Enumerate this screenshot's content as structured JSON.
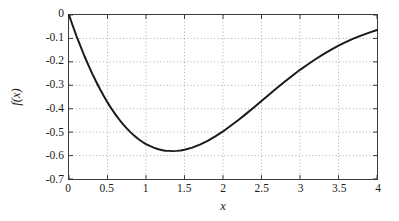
{
  "chart_data": {
    "type": "line",
    "title": "",
    "xlabel": "x",
    "ylabel": "f(x)",
    "xlim": [
      0,
      4
    ],
    "ylim": [
      -0.7,
      0
    ],
    "grid": true,
    "legend": null,
    "xticks": [
      "0",
      "0.5",
      "1",
      "1.5",
      "2",
      "2.5",
      "3",
      "3.5",
      "4"
    ],
    "xtick_values": [
      0,
      0.5,
      1,
      1.5,
      2,
      2.5,
      3,
      3.5,
      4
    ],
    "yticks": [
      "0",
      "-0.1",
      "-0.2",
      "-0.3",
      "-0.4",
      "-0.5",
      "-0.6",
      "-0.7"
    ],
    "ytick_values": [
      0,
      -0.1,
      -0.2,
      -0.3,
      -0.4,
      -0.5,
      -0.6,
      -0.7
    ],
    "series": [
      {
        "name": "f(x)",
        "color": "#1a1a1a",
        "linewidth": 2.0,
        "x": [
          0.0,
          0.05,
          0.1,
          0.15,
          0.2,
          0.25,
          0.3,
          0.35,
          0.4,
          0.45,
          0.5,
          0.55,
          0.6,
          0.65,
          0.7,
          0.75,
          0.8,
          0.85,
          0.9,
          0.95,
          1.0,
          1.05,
          1.1,
          1.15,
          1.2,
          1.25,
          1.3,
          1.35,
          1.4,
          1.45,
          1.5,
          1.6,
          1.7,
          1.8,
          1.9,
          2.0,
          2.1,
          2.2,
          2.3,
          2.4,
          2.5,
          2.6,
          2.7,
          2.8,
          2.9,
          3.0,
          3.1,
          3.2,
          3.3,
          3.4,
          3.5,
          3.6,
          3.7,
          3.8,
          3.9,
          4.0
        ],
        "y": [
          0.0,
          -0.047,
          -0.092,
          -0.134,
          -0.175,
          -0.213,
          -0.249,
          -0.283,
          -0.315,
          -0.345,
          -0.373,
          -0.399,
          -0.423,
          -0.445,
          -0.466,
          -0.484,
          -0.501,
          -0.516,
          -0.529,
          -0.541,
          -0.551,
          -0.559,
          -0.566,
          -0.572,
          -0.576,
          -0.579,
          -0.58,
          -0.581,
          -0.58,
          -0.578,
          -0.575,
          -0.566,
          -0.553,
          -0.537,
          -0.518,
          -0.497,
          -0.473,
          -0.448,
          -0.422,
          -0.395,
          -0.367,
          -0.339,
          -0.312,
          -0.285,
          -0.259,
          -0.234,
          -0.211,
          -0.189,
          -0.168,
          -0.149,
          -0.131,
          -0.115,
          -0.1,
          -0.087,
          -0.075,
          -0.064
        ],
        "minimum": {
          "x": 1.05,
          "y": -0.61
        }
      }
    ]
  }
}
